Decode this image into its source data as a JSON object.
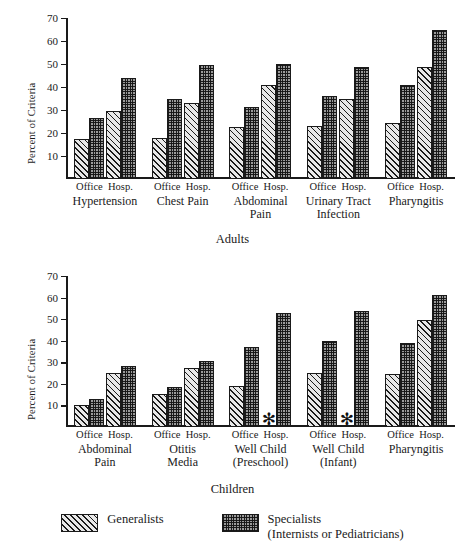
{
  "chart_data": [
    {
      "type": "bar",
      "title": "Adults",
      "panel_caption": "Adults",
      "ylabel": "Percent of Criteria",
      "xlabel": "",
      "ylim": [
        0,
        70
      ],
      "yticks": [
        10,
        20,
        30,
        40,
        50,
        60,
        70
      ],
      "grid": false,
      "legend_position": "bottom",
      "categories": [
        "Hypertension",
        "Chest Pain",
        "Abdominal\nPain",
        "Urinary Tract\nInfection",
        "Pharyngitis"
      ],
      "subcategories": [
        "Office",
        "Hosp."
      ],
      "series": [
        {
          "name": "Generalists",
          "values": [
            17.5,
            29.5,
            18.0,
            33.0,
            22.5,
            41.0,
            23.0,
            35.0,
            24.5,
            48.5
          ]
        },
        {
          "name": "Specialists (Internists or Pediatricians)",
          "values": [
            26.5,
            44.0,
            35.0,
            49.5,
            31.5,
            50.0,
            36.0,
            48.5,
            41.0,
            65.0
          ]
        }
      ]
    },
    {
      "type": "bar",
      "title": "Children",
      "panel_caption": "Children",
      "ylabel": "Percent of Criteria",
      "xlabel": "",
      "ylim": [
        0,
        70
      ],
      "yticks": [
        10,
        20,
        30,
        40,
        50,
        60,
        70
      ],
      "grid": false,
      "legend_position": "bottom",
      "categories": [
        "Abdominal\nPain",
        "Otitis\nMedia",
        "Well Child\n(Preschool)",
        "Well Child\n(Infant)",
        "Pharyngitis"
      ],
      "subcategories": [
        "Office",
        "Hosp."
      ],
      "series": [
        {
          "name": "Generalists",
          "values": [
            10.0,
            25.0,
            15.5,
            27.5,
            19.0,
            null,
            25.0,
            null,
            24.5,
            49.5
          ]
        },
        {
          "name": "Specialists (Internists or Pediatricians)",
          "values": [
            13.0,
            28.5,
            18.5,
            30.5,
            37.0,
            53.0,
            40.0,
            54.0,
            39.0,
            61.0
          ]
        }
      ],
      "missing_marker": "✻",
      "missing_note": "asterisk marks no generalist data"
    }
  ],
  "legend": {
    "items": [
      {
        "label": "Generalists",
        "pattern": "diagonal-hatch",
        "color": "#e8e8e8"
      },
      {
        "label": "Specialists\n(Internists or Pediatricians)",
        "pattern": "cross-hatch",
        "color": "#9b9b9b"
      }
    ]
  }
}
